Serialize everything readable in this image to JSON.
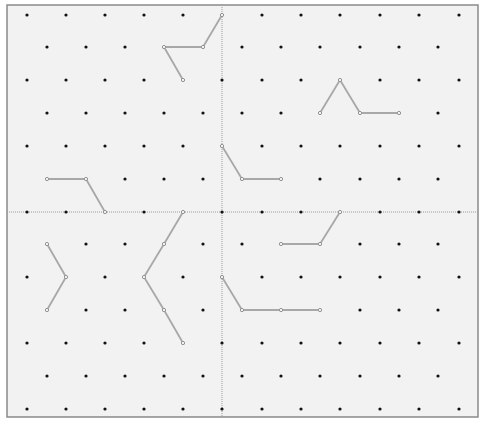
{
  "diagram": {
    "type": "isometric-dot-grid",
    "frame": {
      "x": 7,
      "y": 5,
      "width": 471,
      "height": 412,
      "fill": "#f2f2f2",
      "stroke": "#8a8a8a"
    },
    "grid": {
      "row_y": [
        15,
        47,
        80,
        113,
        146,
        179,
        212,
        244,
        277,
        310,
        343,
        376,
        409
      ],
      "even_row_x": [
        27,
        66,
        105,
        144,
        183,
        222,
        262,
        301,
        340,
        380,
        419,
        459
      ],
      "odd_row_x": [
        47,
        86,
        125,
        164,
        203,
        242,
        281,
        320,
        360,
        399,
        438
      ],
      "dot_color": "#111111",
      "dot_radius": 1.6
    },
    "axes": {
      "vertical_x": 222,
      "horizontal_y": 212,
      "color": "#9a9a9a",
      "dash": "1,1"
    },
    "line_color": "#a8a8a8",
    "vertex_color": "#8c8c8c",
    "shapes": [
      {
        "name": "shape-top-left-hook",
        "points": [
          [
            183,
            80
          ],
          [
            164,
            47
          ],
          [
            203,
            47
          ],
          [
            222,
            15
          ]
        ]
      },
      {
        "name": "shape-left-step",
        "points": [
          [
            47,
            179
          ],
          [
            86,
            179
          ],
          [
            105,
            212
          ]
        ]
      },
      {
        "name": "shape-center-step",
        "points": [
          [
            222,
            146
          ],
          [
            242,
            179
          ],
          [
            281,
            179
          ]
        ]
      },
      {
        "name": "shape-peak-right",
        "points": [
          [
            320,
            113
          ],
          [
            340,
            80
          ],
          [
            360,
            113
          ],
          [
            399,
            113
          ]
        ]
      },
      {
        "name": "shape-right-step-up",
        "points": [
          [
            281,
            244
          ],
          [
            320,
            244
          ],
          [
            340,
            212
          ]
        ]
      },
      {
        "name": "shape-small-chevron",
        "points": [
          [
            47,
            244
          ],
          [
            66,
            277
          ],
          [
            47,
            310
          ]
        ]
      },
      {
        "name": "shape-large-chevron",
        "points": [
          [
            183,
            212
          ],
          [
            164,
            244
          ],
          [
            144,
            277
          ],
          [
            164,
            310
          ],
          [
            183,
            343
          ]
        ]
      },
      {
        "name": "shape-bottom-step",
        "points": [
          [
            222,
            277
          ],
          [
            242,
            310
          ],
          [
            281,
            310
          ],
          [
            320,
            310
          ]
        ]
      }
    ]
  }
}
